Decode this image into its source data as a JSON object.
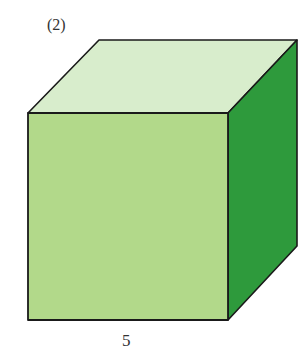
{
  "figure": {
    "label": "(2)",
    "shape": "cube",
    "dimension_label": "5",
    "colors": {
      "front_face": "#b2d98a",
      "top_face": "#d8edcc",
      "side_face": "#2e9a3c",
      "edge": "#1a1a1a"
    },
    "vertices": {
      "front_top_left": [
        28,
        113
      ],
      "front_top_right": [
        228,
        113
      ],
      "front_bottom_left": [
        28,
        320
      ],
      "front_bottom_right": [
        228,
        320
      ],
      "back_top_left": [
        99,
        40
      ],
      "back_top_right": [
        297,
        40
      ],
      "back_bottom_right": [
        297,
        246
      ]
    }
  }
}
